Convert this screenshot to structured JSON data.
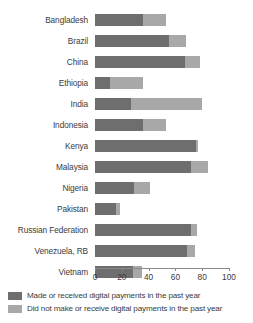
{
  "chart_data": {
    "type": "bar",
    "orientation": "horizontal",
    "stacked": true,
    "title": "",
    "xlabel": "",
    "ylabel": "",
    "xlim": [
      0,
      100
    ],
    "xticks": [
      0,
      20,
      40,
      60,
      80,
      100
    ],
    "xtick_labels": [
      "0",
      "20",
      "40",
      "60",
      "80",
      "100"
    ],
    "grid": false,
    "legend_position": "bottom-left",
    "categories": [
      "Bangladesh",
      "Brazil",
      "China",
      "Ethiopia",
      "India",
      "Indonesia",
      "Kenya",
      "Malaysia",
      "Nigeria",
      "Pakistan",
      "Russian Federation",
      "Venezuela, RB",
      "Vietnam"
    ],
    "series": [
      {
        "name": "Made or received digital payments in the past year",
        "color": "#6e6e6e",
        "values": [
          36,
          55,
          67,
          11,
          27,
          36,
          75,
          72,
          29,
          16,
          72,
          69,
          28
        ]
      },
      {
        "name": "Did not make or receive digital payments in the past year",
        "color": "#a8a8a8",
        "values": [
          17,
          13,
          11,
          25,
          53,
          17,
          2,
          12,
          12,
          3,
          4,
          6,
          7
        ]
      }
    ],
    "totals": [
      53,
      68,
      78,
      36,
      80,
      53,
      77,
      84,
      41,
      19,
      76,
      75,
      35
    ]
  },
  "legend": {
    "items": [
      {
        "label": "Made or received digital payments in the past year",
        "color": "#6e6e6e",
        "swatch_name": "legend-swatch-made-received"
      },
      {
        "label": "Did not make or receive digital payments in the past year",
        "color": "#a8a8a8",
        "swatch_name": "legend-swatch-did-not"
      }
    ]
  }
}
